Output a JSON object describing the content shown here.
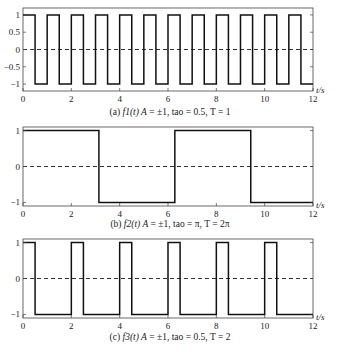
{
  "chart_data": [
    {
      "type": "line",
      "title": "(a) f1(t) A = ±1, tao = 0.5, T = 1",
      "caption_prefix": "(a) ",
      "caption_func": "f1(t) A",
      "caption_rest": " = ±1, tao = 0.5, T = 1",
      "xlabel": "t/s",
      "ylabel": "",
      "xlim": [
        0,
        12
      ],
      "ylim": [
        -1.2,
        1.2
      ],
      "xticks": [
        "0",
        "2",
        "4",
        "6",
        "8",
        "10",
        "12"
      ],
      "yticks": [
        "1",
        "0.5",
        "0",
        "−0.5",
        "−1"
      ],
      "ytick_values": [
        1,
        0.5,
        0,
        -0.5,
        -1
      ],
      "grid": false,
      "series": [
        {
          "name": "f1(t)",
          "style": "square wave",
          "amplitude": 1,
          "high_duration": 0.5,
          "period": 1
        }
      ],
      "reference_line": {
        "y": 0,
        "style": "dashed"
      }
    },
    {
      "type": "line",
      "title": "(b) f2(t) A = ±1, tao = π, T = 2π",
      "caption_prefix": "(b) ",
      "caption_func": "f2(t) A",
      "caption_rest": " = ±1, tao = π, T = 2π",
      "xlabel": "t/s",
      "ylabel": "",
      "xlim": [
        0,
        12
      ],
      "ylim": [
        -1.1,
        1.1
      ],
      "xticks": [
        "0",
        "2",
        "4",
        "6",
        "8",
        "10",
        "12"
      ],
      "yticks": [
        "1",
        "0",
        "−1"
      ],
      "ytick_values": [
        1,
        0,
        -1
      ],
      "grid": false,
      "series": [
        {
          "name": "f2(t)",
          "style": "square wave",
          "amplitude": 1,
          "high_duration": 3.14159,
          "period": 6.28318
        }
      ],
      "reference_line": {
        "y": 0,
        "style": "dashed"
      }
    },
    {
      "type": "line",
      "title": "(c) f3(t) A = ±1, tao = 0.5, T = 2",
      "caption_prefix": "(c) ",
      "caption_func": "f3(t) A",
      "caption_rest": " = ±1, tao = 0.5, T = 2",
      "xlabel": "t/s",
      "ylabel": "",
      "xlim": [
        0,
        12
      ],
      "ylim": [
        -1.1,
        1.1
      ],
      "xticks": [
        "0",
        "2",
        "4",
        "6",
        "8",
        "10",
        "12"
      ],
      "yticks": [
        "1",
        "0",
        "−1"
      ],
      "ytick_values": [
        1,
        0,
        -1
      ],
      "grid": false,
      "series": [
        {
          "name": "f3(t)",
          "style": "square wave",
          "amplitude": 1,
          "high_duration": 0.5,
          "period": 2
        }
      ],
      "reference_line": {
        "y": 0,
        "style": "dashed"
      }
    }
  ],
  "colors": {
    "line": "#111111",
    "axis": "#333333",
    "background": "#ffffff"
  }
}
